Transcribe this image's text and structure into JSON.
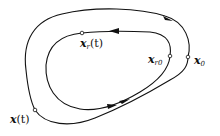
{
  "diagram": {
    "type": "trajectory-diagram",
    "colors": {
      "curve": "#111111",
      "point_fill": "#ffffff",
      "background": "#ffffff"
    },
    "outer_curve": {
      "name": "actual trajectory",
      "arrow_directions": [
        "clockwise-top-right",
        "up-right-bottom"
      ]
    },
    "inner_curve": {
      "name": "reference trajectory",
      "arrow_directions": [
        "left-top",
        "right-bottom"
      ]
    },
    "points": {
      "x0": {
        "symbol": "x",
        "subscript": "0",
        "suffix": ""
      },
      "xt": {
        "symbol": "x",
        "subscript": "",
        "suffix": "(t)"
      },
      "xr0": {
        "symbol": "x",
        "subscript": "r0",
        "suffix": ""
      },
      "xrt": {
        "symbol": "x",
        "subscript": "r",
        "suffix": "(t)"
      }
    }
  }
}
